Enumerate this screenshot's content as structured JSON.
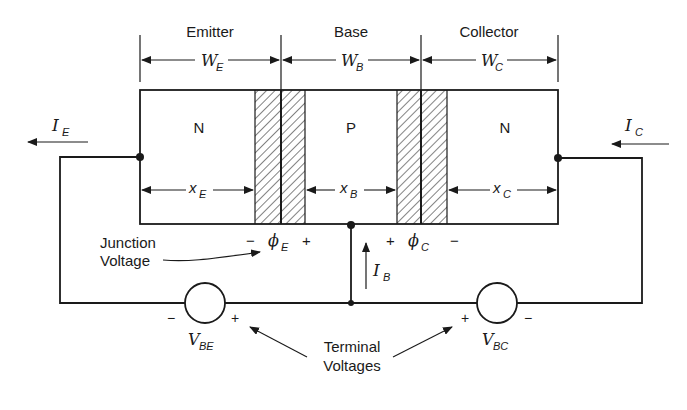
{
  "regions": {
    "emitter": {
      "title": "Emitter",
      "width_symbol": "W",
      "width_sub": "E",
      "doping": "N",
      "neutral_symbol": "x",
      "neutral_sub": "E"
    },
    "base": {
      "title": "Base",
      "width_symbol": "W",
      "width_sub": "B",
      "doping": "P",
      "neutral_symbol": "x",
      "neutral_sub": "B"
    },
    "collector": {
      "title": "Collector",
      "width_symbol": "W",
      "width_sub": "C",
      "doping": "N",
      "neutral_symbol": "x",
      "neutral_sub": "C"
    }
  },
  "currents": {
    "emitter": {
      "symbol": "I",
      "sub": "E"
    },
    "collector": {
      "symbol": "I",
      "sub": "C"
    },
    "base": {
      "symbol": "I",
      "sub": "B"
    }
  },
  "junction_voltages": {
    "label_line1": "Junction",
    "label_line2": "Voltage",
    "emitter": {
      "minus": "−",
      "symbol": "ϕ",
      "sub": "E",
      "plus": "+"
    },
    "collector": {
      "plus": "+",
      "symbol": "ϕ",
      "sub": "C",
      "minus": "−"
    }
  },
  "terminal_voltages": {
    "label_line1": "Terminal",
    "label_line2": "Voltages",
    "vbe": {
      "symbol": "V",
      "sub": "BE",
      "minus": "−",
      "plus": "+"
    },
    "vbc": {
      "symbol": "V",
      "sub": "BC",
      "plus": "+",
      "minus": "−"
    }
  },
  "colors": {
    "ink": "#1a1a1a",
    "background": "#ffffff"
  }
}
